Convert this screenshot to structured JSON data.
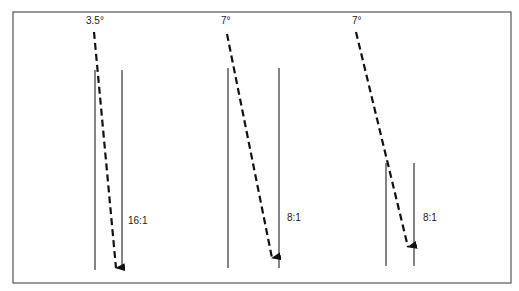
{
  "figure": {
    "frame": {
      "x": 13,
      "y": 12,
      "width": 498,
      "height": 271,
      "stroke": "#555555"
    },
    "panels": [
      {
        "angle_label": "3.5°",
        "ratio_label": "16:1",
        "angle_pos": {
          "x": 86,
          "y": 24
        },
        "ratio_pos": {
          "x": 128,
          "y": 224
        },
        "beam": {
          "x1": 94,
          "y1": 32,
          "x2": 116,
          "y2": 268
        },
        "left_post": {
          "x": 95,
          "y1": 70,
          "y2": 270
        },
        "right_post": {
          "x": 122,
          "y1": 70,
          "y2": 270
        }
      },
      {
        "angle_label": "7°",
        "ratio_label": "8:1",
        "angle_pos": {
          "x": 221,
          "y": 24
        },
        "ratio_pos": {
          "x": 287,
          "y": 221
        },
        "beam": {
          "x1": 227,
          "y1": 34,
          "x2": 272,
          "y2": 258
        },
        "left_post": {
          "x": 228,
          "y1": 68,
          "y2": 268
        },
        "right_post": {
          "x": 279,
          "y1": 68,
          "y2": 268
        }
      },
      {
        "angle_label": "7°",
        "ratio_label": "8:1",
        "angle_pos": {
          "x": 352,
          "y": 24
        },
        "ratio_pos": {
          "x": 423,
          "y": 221
        },
        "beam": {
          "x1": 356,
          "y1": 32,
          "x2": 408,
          "y2": 247
        },
        "left_post": {
          "x": 386,
          "y1": 163,
          "y2": 266
        },
        "right_post": {
          "x": 414,
          "y1": 163,
          "y2": 266
        }
      }
    ],
    "colors": {
      "line": "#333333",
      "beam": "#111111",
      "text": "#222222"
    }
  }
}
